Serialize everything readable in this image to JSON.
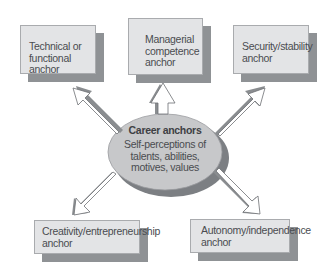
{
  "diagram": {
    "title": "Career anchors",
    "center": {
      "title": "Career anchors",
      "lines": [
        "Self-perceptions of",
        "talents, abilities,",
        "motives, values"
      ]
    },
    "anchors": [
      {
        "id": "technical",
        "lines": [
          "Technical or",
          "functional anchor"
        ],
        "position": "top-left"
      },
      {
        "id": "managerial",
        "lines": [
          "Managerial",
          "competence",
          "anchor"
        ],
        "position": "top-center"
      },
      {
        "id": "security",
        "lines": [
          "Security/stability",
          "anchor"
        ],
        "position": "top-right"
      },
      {
        "id": "creativity",
        "lines": [
          "Creativity/entrepreneurship",
          "anchor"
        ],
        "position": "bottom-left"
      },
      {
        "id": "autonomy",
        "lines": [
          "Autonomy/independence",
          "anchor"
        ],
        "position": "bottom-right"
      }
    ],
    "colors": {
      "box_fill": "#e3e4e6",
      "box_shadow": "#8f9295",
      "ellipse_fill": "#c7c8ca",
      "ellipse_shadow": "#7c7f83",
      "arrow_fill": "#ffffff",
      "arrow_shadow": "#8a8d90",
      "text": "#4a4c50"
    }
  }
}
